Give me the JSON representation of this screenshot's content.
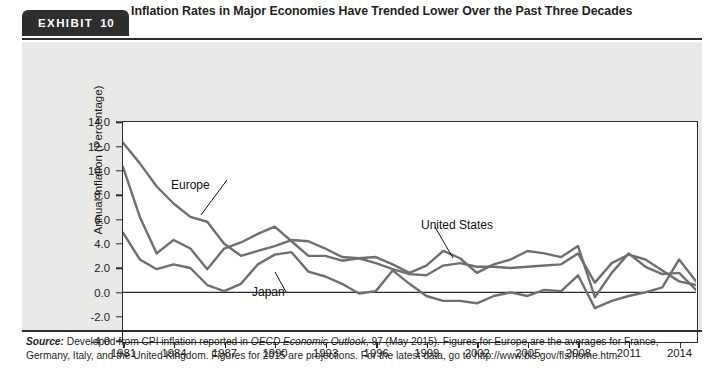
{
  "exhibit": {
    "badge_label": "EXHIBIT",
    "badge_number": "10",
    "title": "Inflation Rates in Major Economies Have Trended Lower Over the Past Three Decades",
    "source_prefix": "Source:",
    "source_line1_a": " Developed from CPI inflation reported in ",
    "source_italic": "OECD Economic Outlook",
    "source_line1_b": ", 97 (May 2015). Figures for Europe are the averages for France,",
    "source_line2": "Germany, Italy, and the United Kingdom. Figures for 2015 are projections. For the latest data, go to http://www.bls.gov/fls/home.htm."
  },
  "colors": {
    "badge_bg": "#2e2e2e",
    "rule": "#2e2e2e",
    "panel_bg": "#e9e9e7",
    "plot_bg": "#ffffff",
    "axis": "#2b2b2b",
    "series_line": "#6f6f6f",
    "text": "#231f20"
  },
  "chart_data": {
    "type": "line",
    "title": "Inflation Rates in Major Economies Have Trended Lower Over the Past Three Decades",
    "xlabel": "",
    "ylabel": "Annual Inflation (Percentage)",
    "xlim": [
      1981,
      2015
    ],
    "ylim": [
      -4.0,
      14.0
    ],
    "yticks": [
      "14.0",
      "12.0",
      "10.0",
      "8.0",
      "6.0",
      "4.0",
      "2.0",
      "0.0",
      "-2.0",
      "-4.0"
    ],
    "ytick_values": [
      14,
      12,
      10,
      8,
      6,
      4,
      2,
      0,
      -2,
      -4
    ],
    "xticks": [
      "1981",
      "1984",
      "1987",
      "1990",
      "1993",
      "1996",
      "1999",
      "2002",
      "2005",
      "2008",
      "2011",
      "2014"
    ],
    "xtick_values": [
      1981,
      1984,
      1987,
      1990,
      1993,
      1996,
      1999,
      2002,
      2005,
      2008,
      2011,
      2014
    ],
    "grid": false,
    "legend": "annotations-on-plot",
    "x": [
      1981,
      1982,
      1983,
      1984,
      1985,
      1986,
      1987,
      1988,
      1989,
      1990,
      1991,
      1992,
      1993,
      1994,
      1995,
      1996,
      1997,
      1998,
      1999,
      2000,
      2001,
      2002,
      2003,
      2004,
      2005,
      2006,
      2007,
      2008,
      2009,
      2010,
      2011,
      2012,
      2013,
      2014,
      2015
    ],
    "series": [
      {
        "name": "Europe",
        "label_position": "upper-left",
        "values": [
          12.3,
          10.6,
          8.7,
          7.3,
          6.2,
          5.8,
          4.0,
          3.0,
          3.4,
          3.8,
          4.3,
          4.2,
          3.6,
          2.9,
          2.8,
          2.4,
          1.9,
          1.5,
          1.4,
          2.2,
          2.4,
          2.1,
          2.1,
          2.0,
          2.1,
          2.2,
          2.3,
          3.2,
          0.8,
          2.4,
          3.1,
          2.7,
          1.8,
          0.9,
          0.6
        ]
      },
      {
        "name": "United States",
        "label_position": "upper-right",
        "values": [
          10.3,
          6.2,
          3.2,
          4.3,
          3.6,
          1.9,
          3.6,
          4.1,
          4.8,
          5.4,
          4.2,
          3.0,
          3.0,
          2.6,
          2.8,
          2.9,
          2.3,
          1.6,
          2.2,
          3.4,
          2.8,
          1.6,
          2.3,
          2.7,
          3.4,
          3.2,
          2.9,
          3.8,
          -0.4,
          1.6,
          3.2,
          2.1,
          1.5,
          1.6,
          0.2
        ]
      },
      {
        "name": "Japan",
        "label_position": "lower-middle",
        "values": [
          4.9,
          2.7,
          1.9,
          2.3,
          2.0,
          0.6,
          0.1,
          0.7,
          2.3,
          3.1,
          3.3,
          1.7,
          1.3,
          0.7,
          -0.1,
          0.1,
          1.8,
          0.7,
          -0.3,
          -0.7,
          -0.7,
          -0.9,
          -0.3,
          0.0,
          -0.3,
          0.2,
          0.1,
          1.4,
          -1.3,
          -0.7,
          -0.3,
          0.0,
          0.4,
          2.7,
          0.9
        ]
      }
    ],
    "annotations": [
      {
        "text": "Europe",
        "x_px": 149,
        "y_px": 136
      },
      {
        "text": "United States",
        "x_px": 399,
        "y_px": 176
      },
      {
        "text": "Japan",
        "x_px": 230,
        "y_px": 243
      }
    ]
  }
}
